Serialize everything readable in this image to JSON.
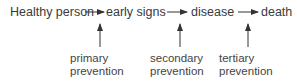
{
  "diagram": {
    "stages": [
      {
        "label": "Healthy person"
      },
      {
        "label": "early signs"
      },
      {
        "label": "disease"
      },
      {
        "label": "death"
      }
    ],
    "interventions": [
      {
        "line1": "primary",
        "line2": "prevention"
      },
      {
        "line1": "secondary",
        "line2": "prevention"
      },
      {
        "line1": "tertiary",
        "line2": "prevention"
      }
    ],
    "colors": {
      "text": "#3a3a3a",
      "arrow": "#333333",
      "background": "#ffffff"
    }
  }
}
